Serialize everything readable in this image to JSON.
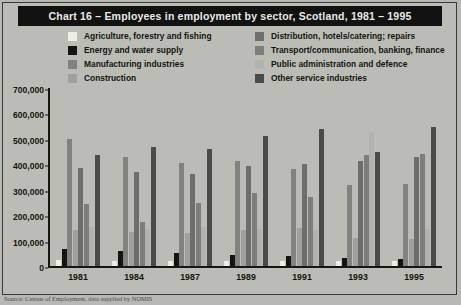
{
  "title": "Chart 16 – Employees in employment by sector, Scotland, 1981 – 1995",
  "source_note": "Source: Census of Employment, data supplied by NOMIS",
  "colors": {
    "background": "#b9b9b4",
    "title_bar": "#121212",
    "title_text": "#e9e9e6",
    "axis": "#17170f",
    "plot_background": "#c2c2bd"
  },
  "legend": {
    "left_column": [
      {
        "label": "Agriculture, forestry and fishing",
        "color": "#efefe8"
      },
      {
        "label": "Energy and water supply",
        "color": "#141410"
      },
      {
        "label": "Manufacturing industries",
        "color": "#828280"
      },
      {
        "label": "Construction",
        "color": "#a0a09c"
      }
    ],
    "right_column": [
      {
        "label": "Distribution, hotels/catering; repairs",
        "color": "#6e6e6c"
      },
      {
        "label": "Transport/communication, banking, finance",
        "color": "#7d7d7a"
      },
      {
        "label": "Public administration and defence",
        "color": "#b3b3ad"
      },
      {
        "label": "Other service industries",
        "color": "#4b4b49"
      }
    ]
  },
  "chart_data": {
    "type": "bar",
    "title": "Chart 16 – Employees in employment by sector, Scotland, 1981 – 1995",
    "xlabel": "",
    "ylabel": "",
    "ylim": [
      0,
      700000
    ],
    "yticks": [
      "0",
      "100,000",
      "200,000",
      "300,000",
      "400,000",
      "500,000",
      "600,000",
      "700,000"
    ],
    "ytick_values": [
      0,
      100000,
      200000,
      300000,
      400000,
      500000,
      600000,
      700000
    ],
    "grid": false,
    "legend_position": "top",
    "categories": [
      "1981",
      "1984",
      "1987",
      "1989",
      "1991",
      "1993",
      "1995"
    ],
    "series": [
      {
        "name": "Agriculture, forestry and fishing",
        "color": "#efefe8",
        "values": [
          22000,
          21000,
          20000,
          19000,
          19000,
          18000,
          18000
        ]
      },
      {
        "name": "Energy and water supply",
        "color": "#141410",
        "values": [
          65000,
          60000,
          50000,
          45000,
          40000,
          32000,
          28000
        ]
      },
      {
        "name": "Manufacturing industries",
        "color": "#828280",
        "values": [
          500000,
          430000,
          405000,
          412000,
          380000,
          318000,
          322000
        ]
      },
      {
        "name": "Construction",
        "color": "#a0a09c",
        "values": [
          140000,
          135000,
          128000,
          140000,
          148000,
          110000,
          108000
        ]
      },
      {
        "name": "Distribution, hotels/catering; repairs",
        "color": "#6e6e6c",
        "values": [
          385000,
          368000,
          362000,
          392000,
          400000,
          412000,
          430000
        ]
      },
      {
        "name": "Transport/communication, banking, finance",
        "color": "#7d7d7a",
        "values": [
          245000,
          172000,
          248000,
          288000,
          270000,
          435000,
          440000
        ]
      },
      {
        "name": "Public administration and defence",
        "color": "#b3b3ad",
        "values": [
          152000,
          146000,
          152000,
          145000,
          140000,
          528000,
          145000
        ]
      },
      {
        "name": "Other service industries",
        "color": "#4b4b49",
        "values": [
          438000,
          470000,
          462000,
          512000,
          540000,
          448000,
          545000
        ]
      }
    ]
  }
}
